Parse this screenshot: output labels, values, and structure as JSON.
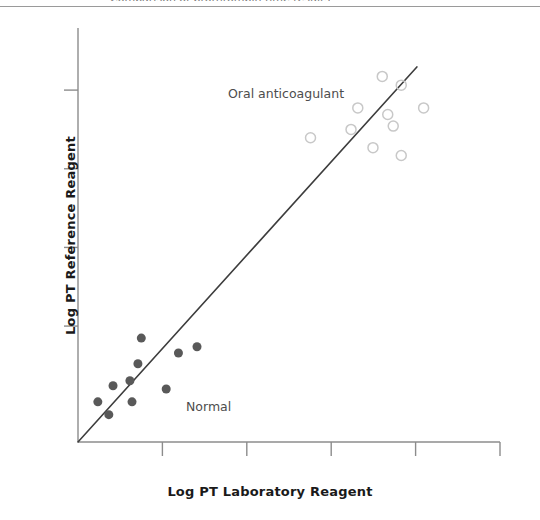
{
  "figure": {
    "clipped_caption_text": "Comparison of prothrombin time results",
    "background_color": "#ffffff"
  },
  "chart_data": {
    "type": "scatter",
    "title": "",
    "xlabel": "Log PT Laboratory Reagent",
    "ylabel": "Log PT Reference Reagent",
    "xlim": [
      0,
      10
    ],
    "ylim": [
      0,
      10
    ],
    "grid": false,
    "legend_position": "none",
    "axis_color": "#8c8c8c",
    "xticks": [
      2,
      4,
      6,
      8,
      10
    ],
    "xtick_labels": [
      "",
      "",
      "",
      "",
      ""
    ],
    "yticks": [
      2.8,
      4.7,
      6.6,
      8.5
    ],
    "ytick_labels": [
      "",
      "",
      "",
      ""
    ],
    "series": [
      {
        "name": "Normal",
        "marker": "filled-circle",
        "color": "#595959",
        "marker_size": 9,
        "points": [
          {
            "x": 1.5,
            "y": 2.51
          },
          {
            "x": 2.38,
            "y": 2.15
          },
          {
            "x": 2.82,
            "y": 2.3
          },
          {
            "x": 1.42,
            "y": 1.89
          },
          {
            "x": 1.23,
            "y": 1.48
          },
          {
            "x": 0.83,
            "y": 1.36
          },
          {
            "x": 2.09,
            "y": 1.28
          },
          {
            "x": 0.47,
            "y": 0.97
          },
          {
            "x": 1.28,
            "y": 0.97
          },
          {
            "x": 0.73,
            "y": 0.66
          }
        ]
      },
      {
        "name": "Oral anticoagulant",
        "marker": "open-circle",
        "color": "#c8c8c8",
        "marker_size": 10,
        "points": [
          {
            "x": 7.21,
            "y": 8.83
          },
          {
            "x": 7.66,
            "y": 8.62
          },
          {
            "x": 6.63,
            "y": 8.07
          },
          {
            "x": 8.19,
            "y": 8.07
          },
          {
            "x": 7.34,
            "y": 7.91
          },
          {
            "x": 6.47,
            "y": 7.55
          },
          {
            "x": 7.47,
            "y": 7.63
          },
          {
            "x": 5.51,
            "y": 7.35
          },
          {
            "x": 6.99,
            "y": 7.11
          },
          {
            "x": 7.66,
            "y": 6.92
          }
        ]
      }
    ],
    "fit_line": {
      "label": "identity-line",
      "color": "#3d3d3d",
      "x_start": 0,
      "y_start": 0,
      "x_end": 8.03,
      "y_end": 9.06
    },
    "annotations": [
      {
        "name": "oral-anticoagulant-label",
        "text": "Oral anticoagulant",
        "x": 4.5,
        "y": 9.0
      },
      {
        "name": "normal-label",
        "text": "Normal",
        "x": 2.55,
        "y": 1.2
      }
    ]
  }
}
